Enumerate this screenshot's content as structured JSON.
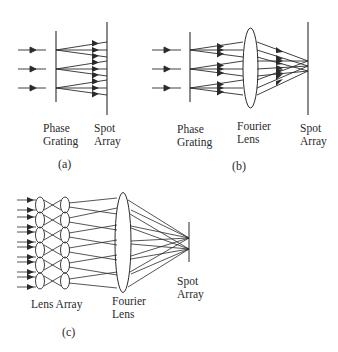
{
  "figure": {
    "panels": [
      {
        "id": "a",
        "caption": "(a)",
        "labels": {
          "grating_line1": "Phase",
          "grating_line2": "Grating",
          "spot_line1": "Spot",
          "spot_line2": "Array"
        }
      },
      {
        "id": "b",
        "caption": "(b)",
        "labels": {
          "grating_line1": "Phase",
          "grating_line2": "Grating",
          "lens_line1": "Fourier",
          "lens_line2": "Lens",
          "spot_line1": "Spot",
          "spot_line2": "Array"
        }
      },
      {
        "id": "c",
        "caption": "(c)",
        "labels": {
          "lens_array": "Lens Array",
          "lens_line1": "Fourier",
          "lens_line2": "Lens",
          "spot_line1": "Spot",
          "spot_line2": "Array"
        }
      }
    ],
    "colors": {
      "stroke": "#2a2a2a",
      "background": "#ffffff"
    }
  }
}
